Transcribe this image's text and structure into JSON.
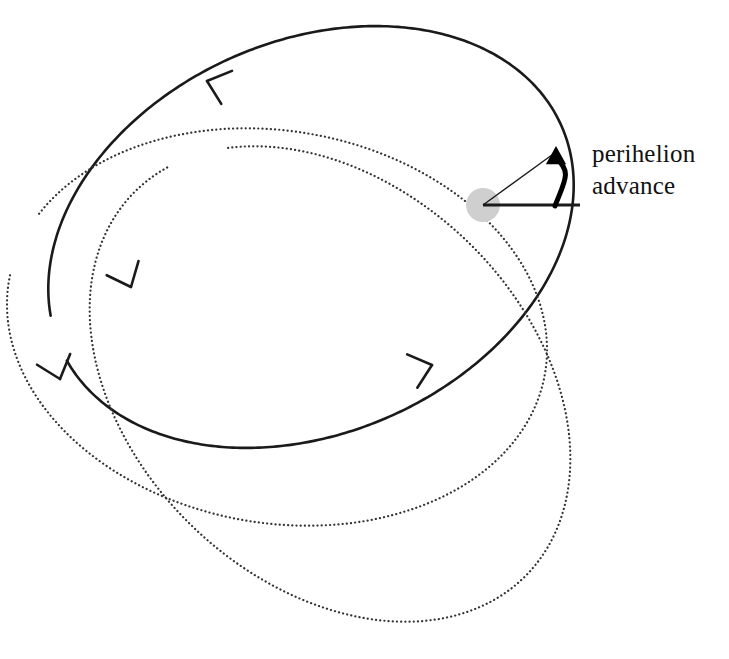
{
  "figure": {
    "kind": "orbital-precession-diagram",
    "background_color": "#ffffff",
    "width": 729,
    "height": 659
  },
  "annotation": {
    "label_line1": "perihelion",
    "label_line2": "advance",
    "text_color": "#111111",
    "font_size_px": 25
  },
  "central_body": {
    "name": "sun",
    "cx": 483,
    "cy": 205,
    "r": 17,
    "fill": "#cfcfcf"
  },
  "radial_lines": {
    "stroke": "#1a1a1a",
    "reference": {
      "x1": 483,
      "y1": 205,
      "x2": 580,
      "y2": 205,
      "width": 3.2
    },
    "advanced": {
      "x1": 483,
      "y1": 205,
      "x2": 556,
      "y2": 152,
      "width": 1.3
    }
  },
  "angle_arrow": {
    "stroke": "#000000",
    "width": 5,
    "from_x": 555,
    "from_y": 206,
    "to_x": 556,
    "to_y": 152,
    "arrowhead_size": 13
  },
  "chart_data": {
    "type": "scatter",
    "title": "",
    "xlabel": "",
    "ylabel": "",
    "focus": [
      483,
      205
    ],
    "perihelion_advance_deg": 36,
    "orbits": [
      {
        "name": "orbit-solid",
        "style": "solid",
        "stroke": "#1a1a1a",
        "stroke_width": 2.6,
        "semi_major": 274,
        "semi_minor": 196,
        "center": [
          311,
          237
        ],
        "rotation_deg": -24,
        "sweep_start_deg": -170,
        "sweep_end_deg": 176
      },
      {
        "name": "orbit-dotted-inner",
        "style": "dotted",
        "stroke": "#333333",
        "stroke_width": 2.2,
        "semi_major": 272,
        "semi_minor": 196,
        "center": [
          277,
          327
        ],
        "rotation_deg": 10,
        "sweep_start_deg": -159,
        "sweep_end_deg": 182
      },
      {
        "name": "orbit-dotted-outer",
        "style": "dotted",
        "stroke": "#333333",
        "stroke_width": 2.2,
        "semi_major": 274,
        "semi_minor": 198,
        "center": [
          330,
          384
        ],
        "rotation_deg": 44,
        "sweep_start_deg": -150,
        "sweep_end_deg": 193
      }
    ],
    "direction_markers": [
      {
        "name": "arrowhead-top-left",
        "x": 207,
        "y": 81,
        "angle_deg": 198,
        "on": "orbit-solid"
      },
      {
        "name": "arrowhead-left",
        "x": 131,
        "y": 287,
        "angle_deg": 66,
        "on": "orbit-solid"
      },
      {
        "name": "arrowhead-bottom",
        "x": 432,
        "y": 365,
        "angle_deg": -17,
        "on": "orbit-solid"
      },
      {
        "name": "arrowhead-dotted-left",
        "x": 60,
        "y": 379,
        "angle_deg": 72,
        "on": "orbit-dotted-inner"
      }
    ]
  }
}
